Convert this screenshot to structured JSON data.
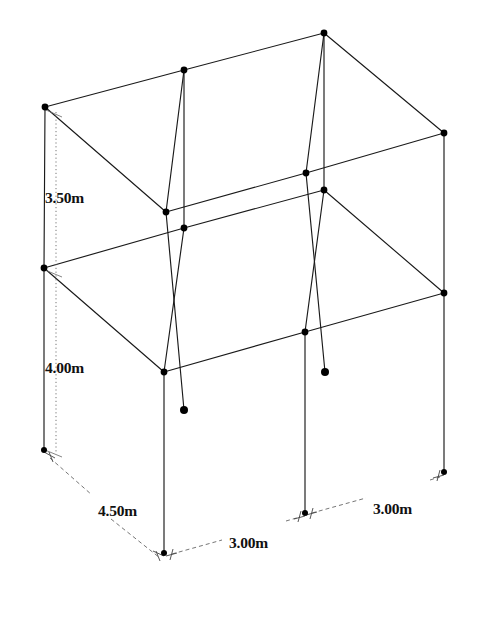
{
  "figure": {
    "background_color": "#ffffff",
    "line_color": "#1a1a1a",
    "node_color": "#000000",
    "dimension_line_color": "#555555"
  },
  "dimensions": [
    {
      "id": "upper-storey-height",
      "label": "3.50m",
      "value": 3.5,
      "unit": "m",
      "axis": "vertical",
      "x": 44,
      "y": 197
    },
    {
      "id": "lower-storey-height",
      "label": "4.00m",
      "value": 4.0,
      "unit": "m",
      "axis": "vertical",
      "x": 44,
      "y": 367
    },
    {
      "id": "depth-span",
      "label": "4.50m",
      "value": 4.5,
      "unit": "m",
      "axis": "depth",
      "x": 98,
      "y": 508
    },
    {
      "id": "front-bay-span",
      "label": "3.00m",
      "value": 3.0,
      "unit": "m",
      "axis": "width",
      "x": 229,
      "y": 540
    },
    {
      "id": "right-bay-span",
      "label": "3.00m",
      "value": 3.0,
      "unit": "m",
      "axis": "width",
      "x": 373,
      "y": 506
    }
  ],
  "geometry": {
    "nodes": [
      {
        "id": "T-back-left",
        "x": 45,
        "y": 107,
        "level": "roof"
      },
      {
        "id": "T-back-mid",
        "x": 184,
        "y": 70,
        "level": "roof"
      },
      {
        "id": "T-back-right",
        "x": 324,
        "y": 33,
        "level": "roof"
      },
      {
        "id": "T-right",
        "x": 444,
        "y": 133,
        "level": "roof"
      },
      {
        "id": "T-front-mid",
        "x": 306,
        "y": 173,
        "level": "roof"
      },
      {
        "id": "T-front-left",
        "x": 166,
        "y": 212,
        "level": "roof"
      },
      {
        "id": "M-back-left",
        "x": 44,
        "y": 268,
        "level": "mid"
      },
      {
        "id": "M-back-mid",
        "x": 184,
        "y": 228,
        "level": "mid"
      },
      {
        "id": "M-back-right",
        "x": 324,
        "y": 190,
        "level": "mid"
      },
      {
        "id": "M-right",
        "x": 444,
        "y": 293,
        "level": "mid"
      },
      {
        "id": "M-front-mid",
        "x": 305,
        "y": 332,
        "level": "mid"
      },
      {
        "id": "M-front-left",
        "x": 164,
        "y": 372,
        "level": "mid"
      },
      {
        "id": "B-back-left",
        "x": 44,
        "y": 450,
        "level": "base"
      },
      {
        "id": "B-front-left",
        "x": 164,
        "y": 553,
        "level": "base"
      },
      {
        "id": "B-front-mid",
        "x": 305,
        "y": 513,
        "level": "base"
      },
      {
        "id": "B-right",
        "x": 444,
        "y": 472,
        "level": "base"
      },
      {
        "id": "S-stub-left",
        "x": 184,
        "y": 410,
        "level": "stub-end"
      },
      {
        "id": "S-stub-right",
        "x": 325,
        "y": 372,
        "level": "stub-end"
      }
    ],
    "members": [
      {
        "from": "T-back-left",
        "to": "T-back-mid",
        "type": "beam"
      },
      {
        "from": "T-back-mid",
        "to": "T-back-right",
        "type": "beam"
      },
      {
        "from": "T-back-right",
        "to": "T-right",
        "type": "beam"
      },
      {
        "from": "T-right",
        "to": "T-front-mid",
        "type": "beam"
      },
      {
        "from": "T-front-mid",
        "to": "T-front-left",
        "type": "beam"
      },
      {
        "from": "T-front-left",
        "to": "T-back-left",
        "type": "beam"
      },
      {
        "from": "T-back-mid",
        "to": "T-front-left",
        "type": "beam"
      },
      {
        "from": "T-back-right",
        "to": "T-front-mid",
        "type": "beam"
      },
      {
        "from": "M-back-left",
        "to": "M-back-mid",
        "type": "beam"
      },
      {
        "from": "M-back-mid",
        "to": "M-back-right",
        "type": "beam"
      },
      {
        "from": "M-back-right",
        "to": "M-right",
        "type": "beam"
      },
      {
        "from": "M-right",
        "to": "M-front-mid",
        "type": "beam"
      },
      {
        "from": "M-front-mid",
        "to": "M-front-left",
        "type": "beam"
      },
      {
        "from": "M-front-left",
        "to": "M-back-left",
        "type": "beam"
      },
      {
        "from": "M-back-mid",
        "to": "M-front-left",
        "type": "beam"
      },
      {
        "from": "M-back-right",
        "to": "M-front-mid",
        "type": "beam"
      },
      {
        "from": "T-back-left",
        "to": "M-back-left",
        "type": "column"
      },
      {
        "from": "T-back-mid",
        "to": "M-back-mid",
        "type": "column"
      },
      {
        "from": "T-back-right",
        "to": "M-back-right",
        "type": "column"
      },
      {
        "from": "T-right",
        "to": "M-right",
        "type": "column"
      },
      {
        "from": "T-front-mid",
        "to": "S-stub-right",
        "type": "column-stub"
      },
      {
        "from": "T-front-left",
        "to": "S-stub-left",
        "type": "column-stub"
      },
      {
        "from": "M-back-left",
        "to": "B-back-left",
        "type": "column"
      },
      {
        "from": "M-front-left",
        "to": "B-front-left",
        "type": "column"
      },
      {
        "from": "M-front-mid",
        "to": "B-front-mid",
        "type": "column"
      },
      {
        "from": "M-right",
        "to": "B-right",
        "type": "column"
      }
    ]
  }
}
